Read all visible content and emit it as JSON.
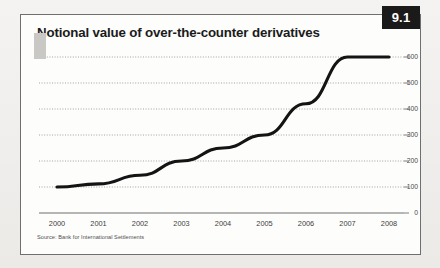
{
  "figure": {
    "badge": "9.1",
    "title": "Notional value of over-the-counter derivatives",
    "source": "Source: Bank for International Settlements"
  },
  "colors": {
    "page_background": "#f2f1ef",
    "card_background": "#fdfdfc",
    "card_border": "#6f6f6f",
    "badge_background": "#1a1a1a",
    "badge_text": "#ffffff",
    "title_text": "#1b1b1b",
    "line": "#141414",
    "gridline": "#9a9a9a",
    "axis": "#6f6f6f",
    "corner_tab": "#c9c8c5"
  },
  "chart_data": {
    "type": "line",
    "title": "Notional value of over-the-counter derivatives",
    "subtitle": "",
    "xlabel": "",
    "ylabel": "",
    "x": [
      "2000",
      "2001",
      "2002",
      "2003",
      "2004",
      "2005",
      "2006",
      "2007",
      "2008"
    ],
    "categories": [
      "2000",
      "2001",
      "2002",
      "2003",
      "2004",
      "2005",
      "2006",
      "2007",
      "2008"
    ],
    "values": [
      100,
      112,
      145,
      200,
      250,
      300,
      420,
      600,
      600
    ],
    "series": [
      {
        "name": "Notional value of over-the-counter derivatives",
        "values": [
          100,
          112,
          145,
          200,
          250,
          300,
          420,
          600,
          600
        ]
      }
    ],
    "ylim": [
      0,
      600
    ],
    "yticks": [
      0,
      100,
      200,
      300,
      400,
      500,
      600
    ],
    "ytick_labels": [
      "0",
      "100",
      "200",
      "300",
      "400",
      "500",
      "600"
    ],
    "xtick_labels": [
      "2000",
      "2001",
      "2002",
      "2003",
      "2004",
      "2005",
      "2006",
      "2007",
      "2008"
    ],
    "y_axis_position": "right",
    "grid": true,
    "grid_style": "dotted-horizontal",
    "legend": false,
    "legend_position": "none",
    "annotations": []
  }
}
